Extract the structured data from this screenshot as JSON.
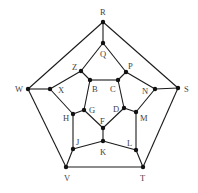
{
  "diagram": {
    "type": "graph",
    "nodes": [
      {
        "id": "R",
        "x": 103,
        "y": 22,
        "lx": 100,
        "ly": 15
      },
      {
        "id": "Q",
        "x": 103,
        "y": 43,
        "lx": 100,
        "ly": 57
      },
      {
        "id": "Z",
        "x": 81,
        "y": 71,
        "lx": 72,
        "ly": 70
      },
      {
        "id": "P",
        "x": 126,
        "y": 72,
        "lx": 128,
        "ly": 69
      },
      {
        "id": "B",
        "x": 90,
        "y": 80,
        "lx": 92,
        "ly": 92
      },
      {
        "id": "C",
        "x": 118,
        "y": 80,
        "lx": 110,
        "ly": 92
      },
      {
        "id": "W",
        "x": 28,
        "y": 89,
        "lx": 15,
        "ly": 92
      },
      {
        "id": "X",
        "x": 50,
        "y": 89,
        "lx": 58,
        "ly": 93
      },
      {
        "id": "N",
        "x": 155,
        "y": 89,
        "lx": 142,
        "ly": 94
      },
      {
        "id": "S",
        "x": 178,
        "y": 88,
        "lx": 184,
        "ly": 92
      },
      {
        "id": "H",
        "x": 73,
        "y": 114,
        "lx": 63,
        "ly": 121
      },
      {
        "id": "G",
        "x": 84,
        "y": 110,
        "lx": 89,
        "ly": 113
      },
      {
        "id": "D",
        "x": 124,
        "y": 108,
        "lx": 113,
        "ly": 112
      },
      {
        "id": "M",
        "x": 136,
        "y": 112,
        "lx": 140,
        "ly": 121
      },
      {
        "id": "F",
        "x": 103,
        "y": 128,
        "lx": 100,
        "ly": 124
      },
      {
        "id": "K",
        "x": 103,
        "y": 141,
        "lx": 100,
        "ly": 155
      },
      {
        "id": "J",
        "x": 73,
        "y": 149,
        "lx": 76,
        "ly": 145
      },
      {
        "id": "L",
        "x": 136,
        "y": 150,
        "lx": 127,
        "ly": 146
      },
      {
        "id": "V",
        "x": 66,
        "y": 167,
        "lx": 64,
        "ly": 181
      },
      {
        "id": "T",
        "x": 143,
        "y": 167,
        "lx": 140,
        "ly": 181
      }
    ],
    "edges": [
      [
        "R",
        "W"
      ],
      [
        "R",
        "S"
      ],
      [
        "W",
        "V"
      ],
      [
        "S",
        "T"
      ],
      [
        "V",
        "T"
      ],
      [
        "R",
        "Q"
      ],
      [
        "W",
        "X"
      ],
      [
        "S",
        "N"
      ],
      [
        "V",
        "J"
      ],
      [
        "T",
        "L"
      ],
      [
        "Q",
        "Z"
      ],
      [
        "Z",
        "X"
      ],
      [
        "X",
        "H"
      ],
      [
        "H",
        "J"
      ],
      [
        "J",
        "K"
      ],
      [
        "K",
        "L"
      ],
      [
        "L",
        "M"
      ],
      [
        "M",
        "N"
      ],
      [
        "N",
        "P"
      ],
      [
        "P",
        "Q"
      ],
      [
        "Z",
        "B"
      ],
      [
        "P",
        "C"
      ],
      [
        "H",
        "G"
      ],
      [
        "M",
        "D"
      ],
      [
        "K",
        "F"
      ],
      [
        "B",
        "C"
      ],
      [
        "C",
        "D"
      ],
      [
        "D",
        "F"
      ],
      [
        "F",
        "G"
      ],
      [
        "G",
        "B"
      ]
    ]
  }
}
